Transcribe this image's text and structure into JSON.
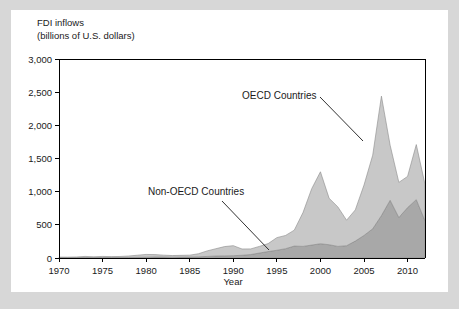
{
  "figure": {
    "background_color": "#d7d7d7",
    "panel_color": "#ffffff"
  },
  "chart_data": {
    "type": "area",
    "stacked": true,
    "title": "FDI inflows",
    "subtitle": "(billions of U.S. dollars)",
    "xlabel": "Year",
    "ylabel": "",
    "xlim": [
      1970,
      2012
    ],
    "ylim": [
      0,
      3000
    ],
    "grid": false,
    "legend_position": "inline-annotations",
    "xticks": [
      1970,
      1975,
      1980,
      1985,
      1990,
      1995,
      2000,
      2005,
      2010
    ],
    "xtick_labels": [
      "1970",
      "1975",
      "1980",
      "1985",
      "1990",
      "1995",
      "2000",
      "2005",
      "2010"
    ],
    "yticks": [
      0,
      500,
      1000,
      1500,
      2000,
      2500,
      3000
    ],
    "ytick_labels": [
      "0",
      "500",
      "1,000",
      "1,500",
      "2,000",
      "2,500",
      "3,000"
    ],
    "x": [
      1970,
      1971,
      1972,
      1973,
      1974,
      1975,
      1976,
      1977,
      1978,
      1979,
      1980,
      1981,
      1982,
      1983,
      1984,
      1985,
      1986,
      1987,
      1988,
      1989,
      1990,
      1991,
      1992,
      1993,
      1994,
      1995,
      1996,
      1997,
      1998,
      1999,
      2000,
      2001,
      2002,
      2003,
      2004,
      2005,
      2006,
      2007,
      2008,
      2009,
      2010,
      2011,
      2012
    ],
    "series": [
      {
        "name": "Non-OECD Countries",
        "color": "#a8a8a8",
        "values": [
          5,
          5,
          6,
          8,
          6,
          8,
          7,
          7,
          8,
          11,
          12,
          16,
          16,
          13,
          14,
          15,
          17,
          24,
          30,
          32,
          35,
          41,
          52,
          75,
          97,
          117,
          140,
          180,
          175,
          195,
          215,
          200,
          175,
          185,
          255,
          340,
          440,
          640,
          870,
          610,
          760,
          880,
          560
        ]
      },
      {
        "name": "OECD Countries",
        "color": "#c8c8c8",
        "values": [
          8,
          8,
          10,
          16,
          12,
          16,
          14,
          16,
          22,
          31,
          42,
          35,
          27,
          24,
          26,
          28,
          47,
          83,
          110,
          140,
          151,
          95,
          85,
          100,
          120,
          190,
          200,
          240,
          510,
          850,
          1085,
          700,
          595,
          385,
          470,
          760,
          1110,
          1800,
          830,
          530,
          470,
          830,
          550
        ]
      }
    ],
    "annotations": [
      {
        "label": "OECD Countries",
        "text_x": 231,
        "text_y": 89,
        "line_x1": 309,
        "line_y1": 87,
        "line_x2": 352,
        "line_y2": 131
      },
      {
        "label": "Non-OECD Countries",
        "text_x": 137,
        "text_y": 185,
        "line_x1": 211,
        "line_y1": 191,
        "line_x2": 258,
        "line_y2": 240
      }
    ]
  }
}
